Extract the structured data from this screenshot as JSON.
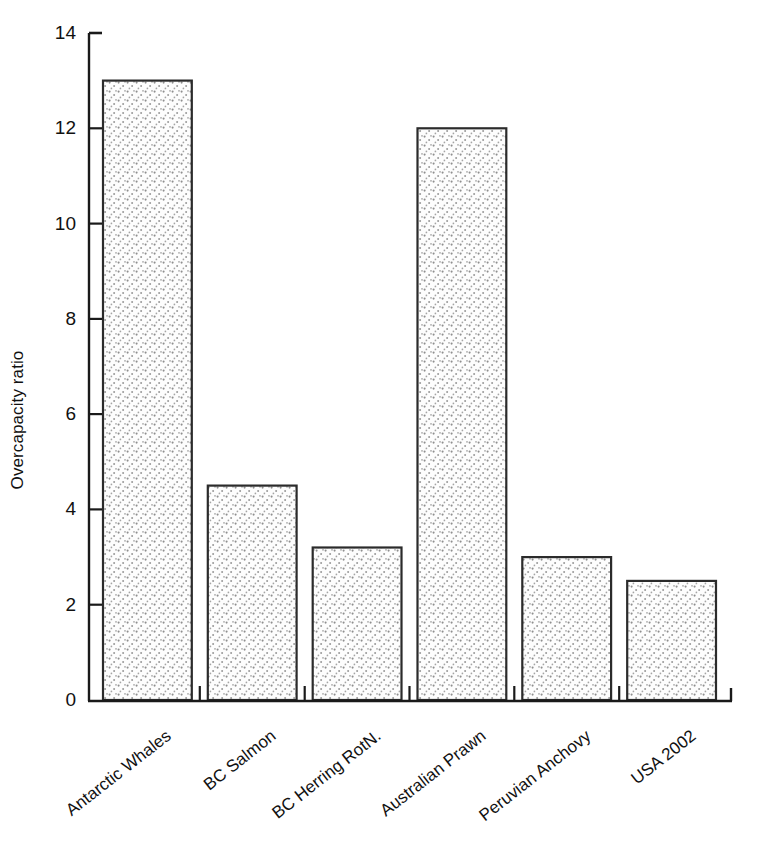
{
  "chart_data": {
    "type": "bar",
    "title": "",
    "xlabel": "",
    "ylabel": "Overcapacity ratio",
    "categories": [
      "Antarctic Whales",
      "BC Salmon",
      "BC Herring RotN.",
      "Australian Prawn",
      "Peruvian Anchovy",
      "USA 2002"
    ],
    "values": [
      13.0,
      4.5,
      3.2,
      12.0,
      3.0,
      2.5
    ],
    "ylim": [
      0,
      14
    ],
    "yticks": [
      0,
      2,
      4,
      6,
      8,
      10,
      12,
      14
    ],
    "ytick_labels": [
      "0",
      "2",
      "4",
      "6",
      "8",
      "10",
      "12",
      "14"
    ],
    "grid": false,
    "legend": false,
    "bar_fill": "#fdfdfd",
    "bar_pattern": "stipple-dots",
    "bar_pattern_color": "#8a8a8a",
    "bar_edge_color": "#2b2b2b",
    "axis_color": "#1a1a1a"
  },
  "axes": {
    "y_title": "Overcapacity ratio"
  }
}
